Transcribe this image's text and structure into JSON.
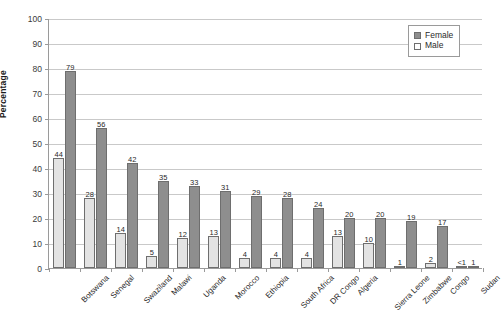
{
  "chart_data": {
    "type": "bar",
    "title": "",
    "xlabel": "",
    "ylabel": "Percentage",
    "ylim": [
      0,
      100
    ],
    "ytick_step": 10,
    "yticks": [
      0,
      10,
      20,
      30,
      40,
      50,
      60,
      70,
      80,
      90,
      100
    ],
    "grid": true,
    "legend_position": "top-right",
    "categories": [
      "Botswana",
      "Senegal",
      "Swaziland",
      "Malawi",
      "Uganda",
      "Morocco",
      "Ethiopia",
      "South Africa",
      "DR Congo",
      "Algeria",
      "Sierra Leone",
      "Zimbabwe",
      "Congo",
      "Sudan"
    ],
    "series": [
      {
        "name": "Male",
        "color": "#e3e3e3",
        "values": [
          44,
          28,
          14,
          5,
          12,
          13,
          4,
          4,
          4,
          13,
          10,
          1,
          2,
          0.4
        ],
        "labels": [
          "44",
          "28",
          "14",
          "5",
          "12",
          "13",
          "4",
          "4",
          "4",
          "13",
          "10",
          "1",
          "2",
          "<1"
        ]
      },
      {
        "name": "Female",
        "color": "#8e8e8e",
        "values": [
          79,
          56,
          42,
          35,
          33,
          31,
          29,
          28,
          24,
          20,
          20,
          19,
          17,
          1
        ],
        "labels": [
          "79",
          "56",
          "42",
          "35",
          "33",
          "31",
          "29",
          "28",
          "24",
          "20",
          "20",
          "19",
          "17",
          "1"
        ]
      }
    ]
  },
  "legend": {
    "items": [
      {
        "label": "Female",
        "swatch": "female"
      },
      {
        "label": "Male",
        "swatch": "male"
      }
    ]
  }
}
